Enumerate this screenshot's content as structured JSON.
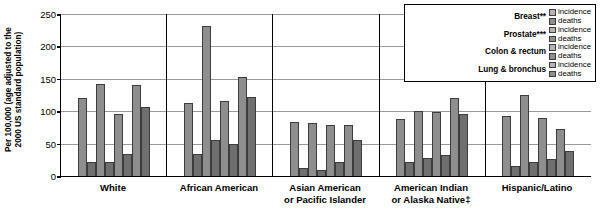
{
  "axis": {
    "y_title": "Per 100,000 (age adjusted to the 2000 US standard population)",
    "y_title_line1": "Per 100,000 (age adjusted to the",
    "y_title_line2": "2000 US standard population)",
    "y_ticks": [
      "250",
      "200",
      "150",
      "100",
      "50",
      "0"
    ]
  },
  "legend": {
    "entries": [
      {
        "name": "Breast**",
        "incidence_label": "incidence",
        "deaths_label": "deaths"
      },
      {
        "name": "Prostate***",
        "incidence_label": "incidence",
        "deaths_label": "deaths"
      },
      {
        "name": "Colon & rectum",
        "incidence_label": "incidence",
        "deaths_label": "deaths"
      },
      {
        "name": "Lung & bronchus",
        "incidence_label": "incidence",
        "deaths_label": "deaths"
      }
    ]
  },
  "groups": [
    {
      "line1": "White",
      "line2": ""
    },
    {
      "line1": "African American",
      "line2": ""
    },
    {
      "line1": "Asian American",
      "line2": "or Pacific Islander"
    },
    {
      "line1": "American Indian",
      "line2": "or Alaska Native‡"
    },
    {
      "line1": "Hispanic/Latino",
      "line2": ""
    }
  ],
  "colors": {
    "incidence": "#8e8e8e",
    "deaths": "#6f6f6f",
    "grid": "#9a9a9a",
    "axis": "#000000",
    "background": "#ffffff"
  },
  "chart_data": {
    "type": "bar",
    "title": "",
    "xlabel": "",
    "ylabel": "Per 100,000 (age adjusted to the 2000 US standard population)",
    "ylim": [
      0,
      250
    ],
    "yticks": [
      0,
      50,
      100,
      150,
      200,
      250
    ],
    "grid": true,
    "legend_position": "top-right",
    "categories": [
      "White",
      "African American",
      "Asian American or Pacific Islander",
      "American Indian or Alaska Native‡",
      "Hispanic/Latino"
    ],
    "series": [
      {
        "name": "Breast** incidence",
        "values": [
          121,
          113,
          83,
          88,
          92
        ]
      },
      {
        "name": "Breast** deaths",
        "values": [
          21,
          34,
          12,
          22,
          16
        ]
      },
      {
        "name": "Prostate*** incidence",
        "values": [
          142,
          232,
          82,
          101,
          125
        ]
      },
      {
        "name": "Prostate*** deaths",
        "values": [
          22,
          55,
          10,
          28,
          22
        ]
      },
      {
        "name": "Colon & rectum incidence",
        "values": [
          95,
          116,
          79,
          99,
          90
        ]
      },
      {
        "name": "Colon & rectum deaths",
        "values": [
          34,
          50,
          22,
          33,
          27
        ]
      },
      {
        "name": "Lung & bronchus incidence",
        "values": [
          140,
          153,
          78,
          120,
          72
        ]
      },
      {
        "name": "Lung & bronchus deaths",
        "values": [
          106,
          122,
          55,
          95,
          39
        ]
      }
    ]
  }
}
